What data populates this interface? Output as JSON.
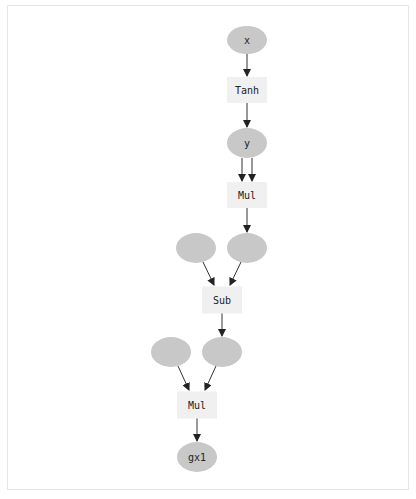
{
  "graph": {
    "title": "",
    "colors": {
      "variable_fill": "#c8c8c8",
      "function_fill": "#f0f0f0",
      "edge": "#333333",
      "label": "#222222",
      "frame_border": "#e6e6e6"
    },
    "nodes": [
      {
        "id": "x",
        "kind": "variable",
        "label": "x",
        "cx": 247,
        "cy": 40,
        "rx": 20,
        "ry": 14
      },
      {
        "id": "tanh",
        "kind": "function",
        "label": "Tanh",
        "cx": 247,
        "cy": 90,
        "w": 40,
        "h": 26
      },
      {
        "id": "y",
        "kind": "variable",
        "label": "y",
        "cx": 247,
        "cy": 143,
        "rx": 20,
        "ry": 15
      },
      {
        "id": "mul1",
        "kind": "function",
        "label": "Mul",
        "cx": 247,
        "cy": 195,
        "w": 40,
        "h": 26
      },
      {
        "id": "v1",
        "kind": "variable",
        "label": "",
        "cx": 196,
        "cy": 248,
        "rx": 20,
        "ry": 15
      },
      {
        "id": "v2",
        "kind": "variable",
        "label": "",
        "cx": 247,
        "cy": 248,
        "rx": 20,
        "ry": 15
      },
      {
        "id": "sub",
        "kind": "function",
        "label": "Sub",
        "cx": 222,
        "cy": 300,
        "w": 40,
        "h": 27
      },
      {
        "id": "v3",
        "kind": "variable",
        "label": "",
        "cx": 171,
        "cy": 352,
        "rx": 20,
        "ry": 15
      },
      {
        "id": "v4",
        "kind": "variable",
        "label": "",
        "cx": 222,
        "cy": 352,
        "rx": 20,
        "ry": 15
      },
      {
        "id": "mul2",
        "kind": "function",
        "label": "Mul",
        "cx": 197,
        "cy": 405,
        "w": 40,
        "h": 27
      },
      {
        "id": "gx1",
        "kind": "variable",
        "label": "gx1",
        "cx": 197,
        "cy": 457,
        "rx": 20,
        "ry": 15
      }
    ],
    "edges": [
      {
        "from": "x",
        "to": "tanh",
        "x1": 247,
        "y1": 54,
        "x2": 247,
        "y2": 76
      },
      {
        "from": "tanh",
        "to": "y",
        "x1": 247,
        "y1": 103,
        "x2": 247,
        "y2": 127
      },
      {
        "from": "y",
        "to": "mul1",
        "x1": 242,
        "y1": 158,
        "x2": 242,
        "y2": 181
      },
      {
        "from": "y",
        "to": "mul1",
        "x1": 252,
        "y1": 158,
        "x2": 252,
        "y2": 181
      },
      {
        "from": "mul1",
        "to": "v2",
        "x1": 247,
        "y1": 208,
        "x2": 247,
        "y2": 232
      },
      {
        "from": "v1",
        "to": "sub",
        "x1": 203,
        "y1": 262,
        "x2": 214,
        "y2": 285
      },
      {
        "from": "v2",
        "to": "sub",
        "x1": 241,
        "y1": 262,
        "x2": 230,
        "y2": 285
      },
      {
        "from": "sub",
        "to": "v4",
        "x1": 222,
        "y1": 313,
        "x2": 222,
        "y2": 336
      },
      {
        "from": "v3",
        "to": "mul2",
        "x1": 178,
        "y1": 366,
        "x2": 189,
        "y2": 390
      },
      {
        "from": "v4",
        "to": "mul2",
        "x1": 216,
        "y1": 366,
        "x2": 205,
        "y2": 390
      },
      {
        "from": "mul2",
        "to": "gx1",
        "x1": 197,
        "y1": 418,
        "x2": 197,
        "y2": 441
      }
    ]
  }
}
